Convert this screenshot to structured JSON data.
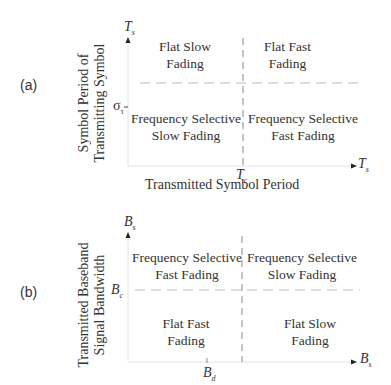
{
  "panel_a": {
    "tag": "(a)",
    "ylabel_line1": "Symbol Period of",
    "ylabel_line2": "Transmitting Symbol",
    "y_axis_symbol": "T",
    "y_axis_sub": "s",
    "y_tick_label": "σ",
    "y_tick_sub": "τ",
    "x_tick_label": "T",
    "x_tick_sub": "c",
    "x_axis_symbol": "T",
    "x_axis_sub": "s",
    "xlabel": "Transmitted Symbol Period",
    "regions": {
      "top_left": [
        "Flat Slow",
        "Fading"
      ],
      "top_right": [
        "Flat Fast",
        "Fading"
      ],
      "bottom_left": [
        "Frequency Selective",
        "Slow Fading"
      ],
      "bottom_right": [
        "Frequency Selective",
        "Fast Fading"
      ]
    }
  },
  "panel_b": {
    "tag": "(b)",
    "ylabel_line1": "Transmitted Baseband",
    "ylabel_line2": "Signal Bandwidth",
    "y_axis_symbol": "B",
    "y_axis_sub": "s",
    "y_tick_label": "B",
    "y_tick_sub": "c",
    "x_tick_label": "B",
    "x_tick_sub": "d",
    "x_axis_symbol": "B",
    "x_axis_sub": "s",
    "regions": {
      "top_left": [
        "Frequency Selective",
        "Fast Fading"
      ],
      "top_right": [
        "Frequency Selective",
        "Slow Fading"
      ],
      "bottom_left": [
        "Flat Fast",
        "Fading"
      ],
      "bottom_right": [
        "Flat Slow",
        "Fading"
      ]
    }
  }
}
